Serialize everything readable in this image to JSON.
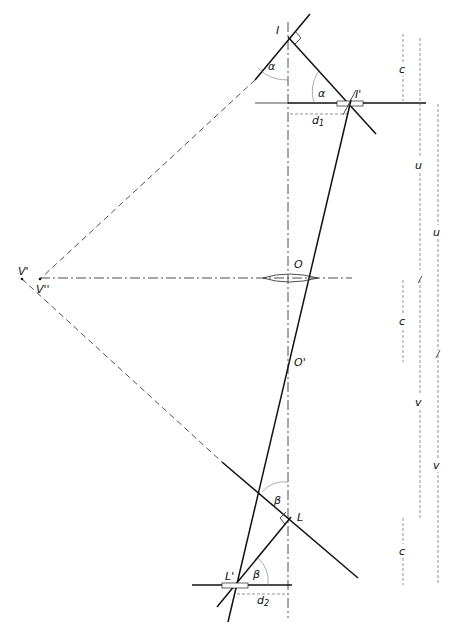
{
  "diagram": {
    "type": "geometric-optics-construction",
    "points": {
      "I": "I",
      "I_prime": "I'",
      "O": "O",
      "O_prime": "O'",
      "L": "L",
      "L_prime": "L'",
      "V_prime": "V'",
      "V_double_prime": "V''"
    },
    "angles": {
      "alpha_top": "α",
      "alpha_mid": "α",
      "beta_top": "β",
      "beta_bottom": "β"
    },
    "distances": {
      "d1": "d",
      "d1_sub": "1",
      "d2": "d",
      "d2_sub": "2"
    },
    "dimensions": {
      "c_top": "c",
      "u_inner": "u",
      "u_outer": "u",
      "c_mid": "c",
      "v_inner": "v",
      "v_outer": "v",
      "c_bottom": "c"
    }
  }
}
